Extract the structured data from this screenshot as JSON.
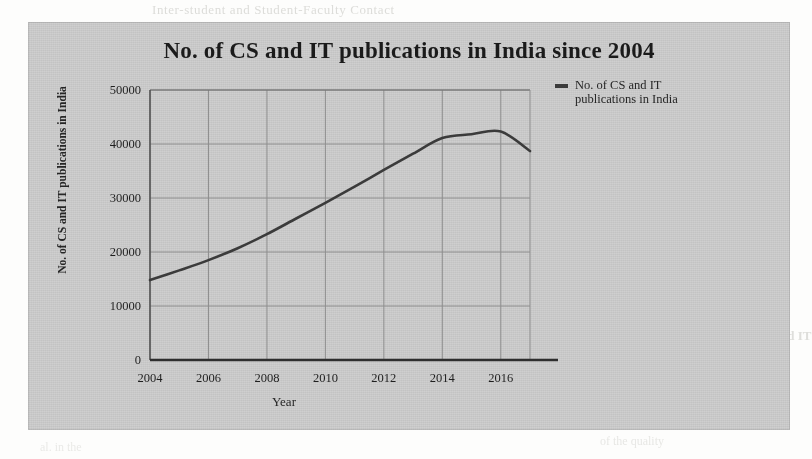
{
  "page": {
    "bleed_through_lines": [
      {
        "id": "b-top",
        "text": "Inter-student and Student-Faculty Contact"
      },
      {
        "id": "b2",
        "text": "the research output and the quality of"
      },
      {
        "id": "b3",
        "text": "Conclusion: Bridging the Gap between"
      },
      {
        "id": "b4",
        "text": "ic Increase and Continuous"
      },
      {
        "id": "b5",
        "text": "The one hand we have seen that the resea"
      },
      {
        "id": "b6",
        "text": "towards the top of the world rankings"
      },
      {
        "id": "b7",
        "text": "has been a steady growth in the number"
      },
      {
        "id": "b8",
        "text": "and the citations received by them"
      },
      {
        "id": "b9",
        "text": "Four Issues: Figure of Major CS and IT"
      },
      {
        "id": "b10",
        "text": "While we note the significant rise in the"
      },
      {
        "id": "b11",
        "text": "publication record over the last decade"
      },
      {
        "id": "b12",
        "text": "of the quality"
      },
      {
        "id": "b13",
        "text": "al. in the"
      },
      {
        "id": "b14",
        "text": "the quality of research"
      },
      {
        "id": "b15",
        "text": "output has grown steadily"
      },
      {
        "id": "b16",
        "text": "in recent years across"
      }
    ]
  },
  "chart_data": {
    "type": "line",
    "title": "No. of CS and IT publications in India since 2004",
    "xlabel": "Year",
    "ylabel": "No. of CS and IT publications in India",
    "legend": {
      "position": "top-right",
      "entries": [
        "No. of CS and IT publications in India"
      ]
    },
    "grid": true,
    "xlim": [
      2004,
      2017
    ],
    "ylim": [
      0,
      50000
    ],
    "xticks": [
      2004,
      2006,
      2008,
      2010,
      2012,
      2014,
      2016
    ],
    "xtick_labels": [
      "2004",
      "2006",
      "2008",
      "2010",
      "2012",
      "2014",
      "2016"
    ],
    "yticks": [
      0,
      10000,
      20000,
      30000,
      40000,
      50000
    ],
    "ytick_labels": [
      "0",
      "10000",
      "20000",
      "30000",
      "40000",
      "50000"
    ],
    "series": [
      {
        "name": "No. of CS and IT publications in India",
        "color": "#3b3b3b",
        "x": [
          2004,
          2005,
          2006,
          2007,
          2008,
          2009,
          2010,
          2011,
          2012,
          2013,
          2014,
          2015,
          2016,
          2017
        ],
        "values": [
          14800,
          16600,
          18500,
          20700,
          23300,
          26200,
          29100,
          32100,
          35200,
          38200,
          41100,
          41800,
          42300,
          38700
        ]
      }
    ]
  }
}
